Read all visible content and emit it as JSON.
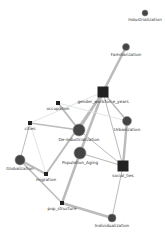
{
  "diagram": {
    "type": "network",
    "colors": {
      "node_fill": "#444444",
      "node_stroke": "#888888",
      "edge": "#bbbbbb",
      "edge_light": "#dddddd",
      "label": "#333333",
      "background": "#ffffff"
    },
    "nodes": [
      {
        "id": "Industrialization",
        "label": "Industrialization",
        "shape": "circle",
        "x": 145,
        "y": 13,
        "size": 3
      },
      {
        "id": "Familiarization",
        "label": "Familiarization",
        "shape": "circle",
        "x": 126,
        "y": 47,
        "size": 3.5
      },
      {
        "id": "gender_workforce_years",
        "label": "gender_workforce_years",
        "shape": "square",
        "x": 103,
        "y": 92,
        "size": 11
      },
      {
        "id": "occupation",
        "label": "occupation",
        "shape": "square",
        "x": 58,
        "y": 103,
        "size": 4
      },
      {
        "id": "cities",
        "label": "cities",
        "shape": "square",
        "x": 30,
        "y": 123,
        "size": 4
      },
      {
        "id": "Urbanization",
        "label": "Urbanization",
        "shape": "circle",
        "x": 127,
        "y": 121,
        "size": 4.5
      },
      {
        "id": "De-industrialization",
        "label": "De-industrialization",
        "shape": "circle",
        "x": 79,
        "y": 130,
        "size": 6
      },
      {
        "id": "Population_Aging",
        "label": "Population_Aging",
        "shape": "circle",
        "x": 80,
        "y": 153,
        "size": 6
      },
      {
        "id": "social_ties",
        "label": "social_ties",
        "shape": "square",
        "x": 123,
        "y": 166,
        "size": 11
      },
      {
        "id": "Globalization",
        "label": "Globalization",
        "shape": "circle",
        "x": 20,
        "y": 160,
        "size": 5
      },
      {
        "id": "migration",
        "label": "migration",
        "shape": "square",
        "x": 46,
        "y": 174,
        "size": 4
      },
      {
        "id": "pop_structure",
        "label": "pop_structure",
        "shape": "square",
        "x": 62,
        "y": 203,
        "size": 4
      },
      {
        "id": "Individualization",
        "label": "Individualization",
        "shape": "circle",
        "x": 112,
        "y": 218,
        "size": 4
      }
    ],
    "edges": [
      {
        "from": "Familiarization",
        "to": "gender_workforce_years",
        "width": 2.5
      },
      {
        "from": "gender_workforce_years",
        "to": "Urbanization",
        "width": 1.5
      },
      {
        "from": "gender_workforce_years",
        "to": "De-industrialization",
        "width": 2
      },
      {
        "from": "gender_workforce_years",
        "to": "Population_Aging",
        "width": 2.5
      },
      {
        "from": "gender_workforce_years",
        "to": "migration",
        "width": 2
      },
      {
        "from": "gender_workforce_years",
        "to": "cities",
        "width": 0.8,
        "light": true
      },
      {
        "from": "gender_workforce_years",
        "to": "social_ties",
        "width": 1
      },
      {
        "from": "occupation",
        "to": "De-industrialization",
        "width": 2
      },
      {
        "from": "occupation",
        "to": "Urbanization",
        "width": 0.8,
        "light": true
      },
      {
        "from": "cities",
        "to": "De-industrialization",
        "width": 1.5
      },
      {
        "from": "cities",
        "to": "Globalization",
        "width": 1
      },
      {
        "from": "cities",
        "to": "migration",
        "width": 0.8,
        "light": true
      },
      {
        "from": "Urbanization",
        "to": "social_ties",
        "width": 2.5
      },
      {
        "from": "De-industrialization",
        "to": "social_ties",
        "width": 1
      },
      {
        "from": "Population_Aging",
        "to": "social_ties",
        "width": 1.2
      },
      {
        "from": "Population_Aging",
        "to": "pop_structure",
        "width": 2.5
      },
      {
        "from": "Globalization",
        "to": "migration",
        "width": 2
      },
      {
        "from": "Globalization",
        "to": "pop_structure",
        "width": 1.5
      },
      {
        "from": "pop_structure",
        "to": "Individualization",
        "width": 2.5
      },
      {
        "from": "social_ties",
        "to": "Individualization",
        "width": 1
      }
    ]
  }
}
